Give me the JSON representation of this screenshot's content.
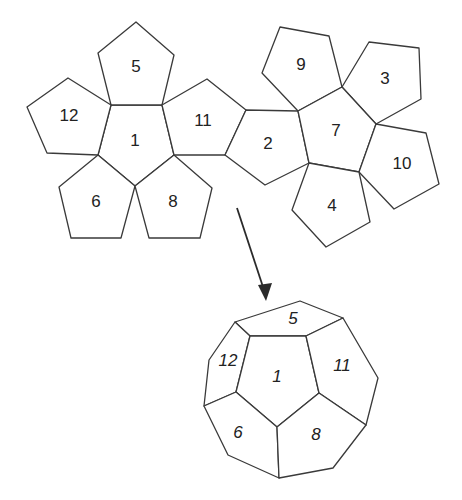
{
  "diagram": {
    "net": {
      "faces": [
        {
          "label": "1",
          "points": "111,105 162,105 174,155 135,186 98,155",
          "label_pos": [
            135,
            142
          ]
        },
        {
          "label": "5",
          "points": "136,22 174,55 162,105 111,105 98,53",
          "label_pos": [
            136,
            68
          ]
        },
        {
          "label": "12",
          "points": "68,78 111,105 98,155 47,153 27,107",
          "label_pos": [
            69,
            117
          ]
        },
        {
          "label": "6",
          "points": "98,155 135,186 121,238 71,238 59,187",
          "label_pos": [
            96,
            203
          ]
        },
        {
          "label": "8",
          "points": "135,186 174,155 212,188 200,238 149,238",
          "label_pos": [
            173,
            203
          ]
        },
        {
          "label": "11",
          "points": "162,105 207,79 246,110 225,155 174,155",
          "label_pos": [
            203,
            122
          ]
        },
        {
          "label": "2",
          "points": "246,110 298,111 309,163 265,185 225,155",
          "label_pos": [
            268,
            145
          ]
        },
        {
          "label": "9",
          "points": "280,27 329,36 342,87 298,111 262,73",
          "label_pos": [
            301,
            66
          ]
        },
        {
          "label": "3",
          "points": "369,42 419,48 421,99 376,124 342,87",
          "label_pos": [
            385,
            80
          ]
        },
        {
          "label": "7",
          "points": "298,111 342,87 376,124 359,172 309,163",
          "label_pos": [
            336,
            132
          ]
        },
        {
          "label": "10",
          "points": "376,124 426,133 439,184 394,209 359,172",
          "label_pos": [
            402,
            165
          ]
        },
        {
          "label": "4",
          "points": "309,163 359,172 370,222 326,247 292,210",
          "label_pos": [
            332,
            207
          ]
        }
      ]
    },
    "arrow": {
      "x1": 237,
      "y1": 208,
      "x2": 264,
      "y2": 290,
      "head": "266,301 258,285 272,283"
    },
    "solid": {
      "faces": [
        {
          "label": "5",
          "points": "235,322 300,301 343,318 306,336 250,336",
          "label_pos": [
            293,
            320
          ]
        },
        {
          "label": "12",
          "points": "235,322 250,336 236,392 204,406 209,360",
          "label_pos": [
            228,
            362
          ]
        },
        {
          "label": "1",
          "points": "250,336 306,336 319,393 277,427 236,392",
          "label_pos": [
            277,
            378
          ]
        },
        {
          "label": "11",
          "points": "306,336 343,318 378,378 366,425 319,393",
          "label_pos": [
            342,
            367
          ]
        },
        {
          "label": "6",
          "points": "236,392 277,427 279,478 228,455 204,406",
          "label_pos": [
            238,
            434
          ]
        },
        {
          "label": "8",
          "points": "277,427 319,393 366,425 333,468 279,478",
          "label_pos": [
            316,
            436
          ]
        }
      ]
    }
  }
}
